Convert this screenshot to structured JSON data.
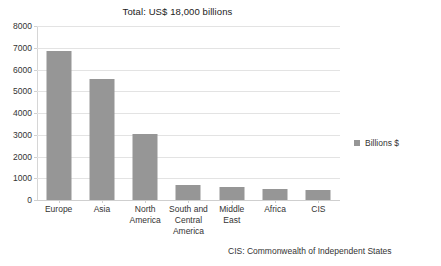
{
  "chart_data": {
    "type": "bar",
    "title": "Total: US$ 18,000 billions",
    "xlabel": "",
    "ylabel": "",
    "categories": [
      "Europe",
      "Asia",
      "North America",
      "South and Central America",
      "Middle East",
      "Africa",
      "CIS"
    ],
    "category_lines": [
      [
        "Europe"
      ],
      [
        "Asia"
      ],
      [
        "North",
        "America"
      ],
      [
        "South and",
        "Central",
        "America"
      ],
      [
        "Middle",
        "East"
      ],
      [
        "Africa"
      ],
      [
        "CIS"
      ]
    ],
    "values": [
      6850,
      5550,
      3050,
      680,
      620,
      510,
      460
    ],
    "series": [
      {
        "name": "Billions $",
        "values": [
          6850,
          5550,
          3050,
          680,
          620,
          510,
          460
        ],
        "color": "#969696"
      }
    ],
    "ylim": [
      0,
      8000
    ],
    "ytick_step": 1000,
    "yticks": [
      8000,
      7000,
      6000,
      5000,
      4000,
      3000,
      2000,
      1000,
      0
    ],
    "ytick_labels": [
      "8000",
      "7000",
      "6000",
      "5000",
      "4000",
      "3000",
      "2000",
      "1000",
      "0"
    ],
    "grid": "horizontal",
    "legend_position": "right",
    "annotation": "CIS: Commonwealth of Independent States",
    "colors": {
      "bar": "#969696",
      "gridline": "#e3e3e3",
      "axis": "#d0d0d0",
      "text": "#333333",
      "background": "#ffffff"
    }
  },
  "legend": {
    "entries": [
      {
        "label": "Billions $",
        "color": "#969696"
      }
    ]
  },
  "footnote": {
    "text": "CIS: Commonwealth of Independent States"
  }
}
